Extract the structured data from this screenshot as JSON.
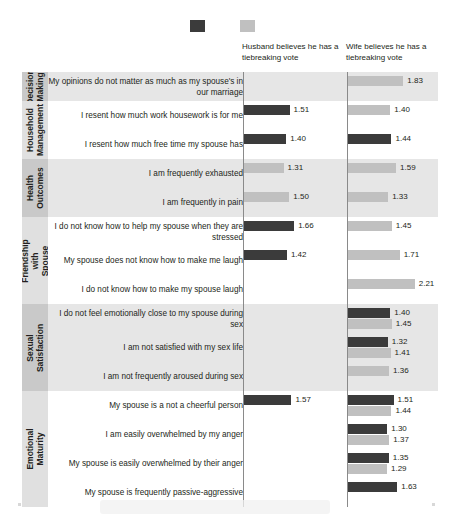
{
  "legend": {
    "items": [
      {
        "label": "Effect on husband",
        "color": "#3b3b3b",
        "name": "husband"
      },
      {
        "label": "Effect on wife",
        "color": "#c0c0c0",
        "name": "wife"
      }
    ]
  },
  "columns": [
    {
      "key": "husband",
      "header": "Husband believes he has a tiebreaking vote"
    },
    {
      "key": "wife",
      "header": "Wife believes he has a tiebreaking vote"
    }
  ],
  "chart_data": {
    "type": "bar",
    "title": "",
    "xlabel": "",
    "ylabel": "",
    "orientation": "horizontal",
    "grid": false,
    "legend_position": "top-center",
    "axis_count": 2,
    "xlim": [
      0,
      2.4
    ],
    "series": [
      {
        "name": "Effect on husband",
        "color": "#3b3b3b"
      },
      {
        "name": "Effect on wife",
        "color": "#c0c0c0"
      }
    ],
    "categories": [
      {
        "label": "Decision Making",
        "rows": [
          {
            "statement": "My opinions do not matter as much as my spouse's in our marriage",
            "husband": {
              "effect_on_husband": null,
              "effect_on_wife": null
            },
            "wife": {
              "effect_on_husband": null,
              "effect_on_wife": 1.83
            }
          }
        ]
      },
      {
        "label": "Household Management",
        "rows": [
          {
            "statement": "I resent how much work housework is for me",
            "husband": {
              "effect_on_husband": 1.51,
              "effect_on_wife": null
            },
            "wife": {
              "effect_on_husband": null,
              "effect_on_wife": 1.4
            }
          },
          {
            "statement": "I resent how much free time my spouse has",
            "husband": {
              "effect_on_husband": 1.4,
              "effect_on_wife": null
            },
            "wife": {
              "effect_on_husband": 1.44,
              "effect_on_wife": null
            }
          }
        ]
      },
      {
        "label": "Health Outcomes",
        "rows": [
          {
            "statement": "I am frequently exhausted",
            "husband": {
              "effect_on_husband": null,
              "effect_on_wife": 1.31
            },
            "wife": {
              "effect_on_husband": null,
              "effect_on_wife": 1.59
            }
          },
          {
            "statement": "I am frequently in pain",
            "husband": {
              "effect_on_husband": null,
              "effect_on_wife": 1.5
            },
            "wife": {
              "effect_on_husband": null,
              "effect_on_wife": 1.33
            }
          }
        ]
      },
      {
        "label": "Friendship with Spouse",
        "rows": [
          {
            "statement": "I do not know how to help my spouse when they are stressed",
            "husband": {
              "effect_on_husband": 1.66,
              "effect_on_wife": null
            },
            "wife": {
              "effect_on_husband": null,
              "effect_on_wife": 1.45
            }
          },
          {
            "statement": "My spouse does not know how to make me laugh",
            "husband": {
              "effect_on_husband": 1.42,
              "effect_on_wife": null
            },
            "wife": {
              "effect_on_husband": null,
              "effect_on_wife": 1.71
            }
          },
          {
            "statement": "I do not know how to make my spouse laugh",
            "husband": {
              "effect_on_husband": null,
              "effect_on_wife": null
            },
            "wife": {
              "effect_on_husband": null,
              "effect_on_wife": 2.21
            }
          }
        ]
      },
      {
        "label": "Sexual Satisfaction",
        "rows": [
          {
            "statement": "I do not feel emotionally close to my spouse during sex",
            "husband": {
              "effect_on_husband": null,
              "effect_on_wife": null
            },
            "wife": {
              "effect_on_husband": 1.4,
              "effect_on_wife": 1.45
            }
          },
          {
            "statement": "I am not satisfied with my sex life",
            "husband": {
              "effect_on_husband": null,
              "effect_on_wife": null
            },
            "wife": {
              "effect_on_husband": 1.32,
              "effect_on_wife": 1.41
            }
          },
          {
            "statement": "I am not frequently aroused during sex",
            "husband": {
              "effect_on_husband": null,
              "effect_on_wife": null
            },
            "wife": {
              "effect_on_husband": null,
              "effect_on_wife": 1.36
            }
          }
        ]
      },
      {
        "label": "Emotional Maturity",
        "rows": [
          {
            "statement": "My spouse is a not a cheerful person",
            "husband": {
              "effect_on_husband": 1.57,
              "effect_on_wife": null
            },
            "wife": {
              "effect_on_husband": 1.51,
              "effect_on_wife": 1.44
            }
          },
          {
            "statement": "I am easily overwhelmed by my anger",
            "husband": {
              "effect_on_husband": null,
              "effect_on_wife": null
            },
            "wife": {
              "effect_on_husband": 1.3,
              "effect_on_wife": 1.37
            }
          },
          {
            "statement": "My spouse is easily overwhelmed by their anger",
            "husband": {
              "effect_on_husband": null,
              "effect_on_wife": null
            },
            "wife": {
              "effect_on_husband": 1.35,
              "effect_on_wife": 1.29
            }
          },
          {
            "statement": "My spouse is frequently passive-aggressive",
            "husband": {
              "effect_on_husband": null,
              "effect_on_wife": null
            },
            "wife": {
              "effect_on_husband": 1.63,
              "effect_on_wife": null
            }
          }
        ]
      }
    ]
  }
}
